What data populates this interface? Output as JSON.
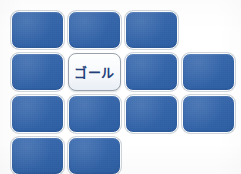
{
  "board": {
    "name": "tile-grid",
    "columns": 4,
    "rows": 4,
    "origin_x": 11,
    "origin_y": 11,
    "cell_width": 57,
    "cell_height": 42,
    "tile_width": 53,
    "tile_height": 38,
    "background_color": "#fdfdfc"
  },
  "colors": {
    "tile_blue": "#2f63ac",
    "tile_blue_border": "#fafbfc",
    "goal_fill": "#fbfcfe",
    "goal_border": "#9aa3ad",
    "goal_text": "#23407a",
    "page_background": "#ffffff"
  },
  "labels": {
    "goal": "ゴール"
  },
  "tiles": [
    {
      "id": "tile-r1c1",
      "row": 1,
      "col": 1,
      "type": "blue",
      "label": ""
    },
    {
      "id": "tile-r1c2",
      "row": 1,
      "col": 2,
      "type": "blue",
      "label": ""
    },
    {
      "id": "tile-r1c3",
      "row": 1,
      "col": 3,
      "type": "blue",
      "label": ""
    },
    {
      "id": "tile-r2c1",
      "row": 2,
      "col": 1,
      "type": "blue",
      "label": ""
    },
    {
      "id": "tile-r2c2",
      "row": 2,
      "col": 2,
      "type": "goal",
      "label": "ゴール"
    },
    {
      "id": "tile-r2c3",
      "row": 2,
      "col": 3,
      "type": "blue",
      "label": ""
    },
    {
      "id": "tile-r2c4",
      "row": 2,
      "col": 4,
      "type": "blue",
      "label": ""
    },
    {
      "id": "tile-r3c1",
      "row": 3,
      "col": 1,
      "type": "blue",
      "label": ""
    },
    {
      "id": "tile-r3c2",
      "row": 3,
      "col": 2,
      "type": "blue",
      "label": ""
    },
    {
      "id": "tile-r3c3",
      "row": 3,
      "col": 3,
      "type": "blue",
      "label": ""
    },
    {
      "id": "tile-r3c4",
      "row": 3,
      "col": 4,
      "type": "blue",
      "label": ""
    },
    {
      "id": "tile-r4c1",
      "row": 4,
      "col": 1,
      "type": "blue",
      "label": ""
    },
    {
      "id": "tile-r4c2",
      "row": 4,
      "col": 2,
      "type": "blue",
      "label": ""
    }
  ]
}
